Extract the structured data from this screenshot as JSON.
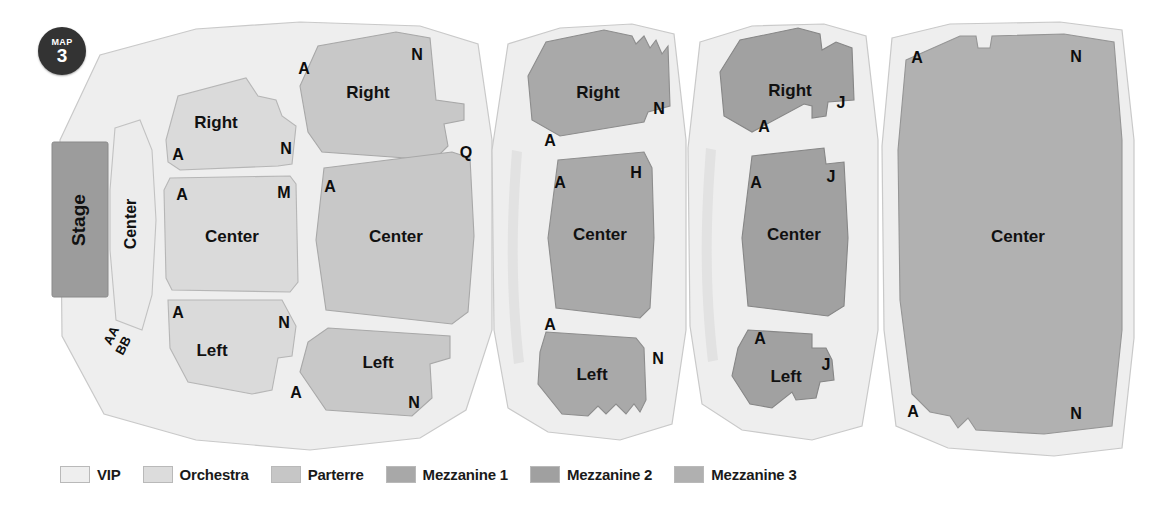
{
  "badge": {
    "top_label": "MAP",
    "number": "3"
  },
  "stage": {
    "label": "Stage"
  },
  "legend": {
    "items": [
      {
        "label": "VIP",
        "color": "#eeeeee"
      },
      {
        "label": "Orchestra",
        "color": "#dcdcdc"
      },
      {
        "label": "Parterre",
        "color": "#c6c6c6"
      },
      {
        "label": "Mezzanine 1",
        "color": "#a8a8a8"
      },
      {
        "label": "Mezzanine 2",
        "color": "#a0a0a0"
      },
      {
        "label": "Mezzanine 3",
        "color": "#b0b0b0"
      }
    ]
  },
  "colors": {
    "vip": "#ececec",
    "orchestra": "#dadada",
    "parterre": "#c8c8c8",
    "mezzanine1": "#a9a9a9",
    "mezzanine2": "#a1a1a1",
    "mezzanine3": "#b1b1b1",
    "stage_fill": "#9c9c9c",
    "backdrop": "#eeeeee",
    "outline": "#b5b5b5",
    "text": "#111111",
    "badge_bg": "#333333"
  },
  "vip": {
    "center_label": "Center",
    "row_aa": "AA",
    "row_bb": "BB"
  },
  "orchestra": {
    "sections": [
      {
        "name": "Right",
        "label": "Right",
        "row_near": "A",
        "row_far": "N"
      },
      {
        "name": "Center",
        "label": "Center",
        "row_near": "A",
        "row_far": "M"
      },
      {
        "name": "Left",
        "label": "Left",
        "row_near": "A",
        "row_far": "N"
      }
    ]
  },
  "parterre": {
    "sections": [
      {
        "name": "Right",
        "label": "Right",
        "row_near": "A",
        "row_far": "N"
      },
      {
        "name": "Center",
        "label": "Center",
        "row_near": "A",
        "row_far": "Q"
      },
      {
        "name": "Left",
        "label": "Left",
        "row_near": "A",
        "row_far": "N"
      }
    ]
  },
  "mezzanine1": {
    "sections": [
      {
        "name": "Right",
        "label": "Right",
        "row_near": "A",
        "row_far": "N"
      },
      {
        "name": "Center",
        "label": "Center",
        "row_near": "A",
        "row_far": "H"
      },
      {
        "name": "Left",
        "label": "Left",
        "row_near": "A",
        "row_far": "N"
      }
    ]
  },
  "mezzanine2": {
    "sections": [
      {
        "name": "Right",
        "label": "Right",
        "row_near": "A",
        "row_far": "J"
      },
      {
        "name": "Center",
        "label": "Center",
        "row_near": "A",
        "row_far": "J"
      },
      {
        "name": "Left",
        "label": "Left",
        "row_near": "A",
        "row_far": "J"
      }
    ]
  },
  "mezzanine3": {
    "sections": [
      {
        "name": "Center",
        "label": "Center",
        "row_near_top": "A",
        "row_far_top": "N",
        "row_near_bottom": "A",
        "row_far_bottom": "N"
      }
    ]
  }
}
